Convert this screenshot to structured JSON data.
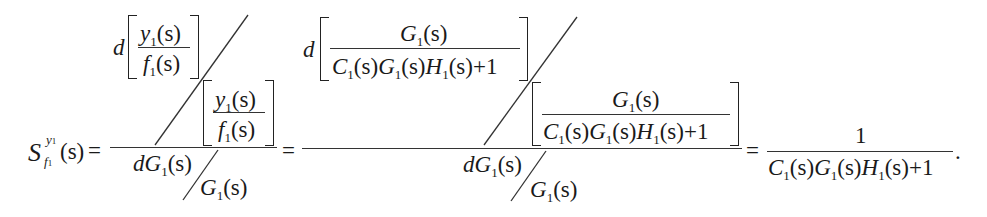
{
  "equation": {
    "lhs": {
      "symbol": "S",
      "sup": "y",
      "sup_sub": "1",
      "sub": "f",
      "sub_sub": "1",
      "arg": "(s)",
      "equals": "="
    },
    "term1": {
      "num_d": "d",
      "num_frac_top": {
        "base": "y",
        "sub": "1",
        "rest": "(s)"
      },
      "num_frac_bottom": {
        "base": "f",
        "sub": "1",
        "rest": "(s)"
      },
      "num_div_frac_top": {
        "base": "y",
        "sub": "1",
        "rest": "(s)"
      },
      "num_div_frac_bottom": {
        "base": "f",
        "sub": "1",
        "rest": "(s)"
      },
      "den_left": {
        "base": "dG",
        "sub": "1",
        "rest": "(s)"
      },
      "den_right": {
        "base": "G",
        "sub": "1",
        "rest": "(s)"
      },
      "equals": "="
    },
    "term2": {
      "num_d": "d",
      "num_frac_top": {
        "base": "G",
        "sub": "1",
        "rest": "(s)"
      },
      "num_frac_bottom": {
        "p1": "C",
        "s1": "1",
        "r1": "(s)",
        "p2": "G",
        "s2": "1",
        "r2": "(s)",
        "p3": "H",
        "s3": "1",
        "r3": "(s)",
        "tail": "+1"
      },
      "num_div_frac_top": {
        "base": "G",
        "sub": "1",
        "rest": "(s)"
      },
      "num_div_frac_bottom": {
        "p1": "C",
        "s1": "1",
        "r1": "(s)",
        "p2": "G",
        "s2": "1",
        "r2": "(s)",
        "p3": "H",
        "s3": "1",
        "r3": "(s)",
        "tail": "+1"
      },
      "den_left": {
        "base": "dG",
        "sub": "1",
        "rest": "(s)"
      },
      "den_right": {
        "base": "G",
        "sub": "1",
        "rest": "(s)"
      },
      "equals": "="
    },
    "result": {
      "numerator": "1",
      "denominator": {
        "p1": "C",
        "s1": "1",
        "r1": "(s)",
        "p2": "G",
        "s2": "1",
        "r2": "(s)",
        "p3": "H",
        "s3": "1",
        "r3": "(s)",
        "tail": "+1"
      },
      "period": "."
    }
  }
}
